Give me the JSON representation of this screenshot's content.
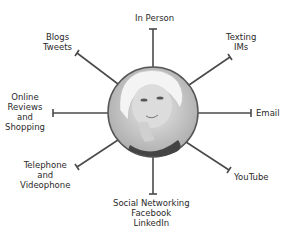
{
  "diagram": {
    "center": {
      "x": 153,
      "y": 112,
      "r": 45,
      "description": "Portrait of a thoughtful blonde woman (grayscale)"
    },
    "line_color": "#4a4a4a",
    "spokes": [
      {
        "id": "in-person",
        "label": "In Person",
        "x2": 153,
        "y2": 29
      },
      {
        "id": "texting",
        "label": "Texting\nIMs",
        "x2": 230,
        "y2": 57
      },
      {
        "id": "email",
        "label": "Email",
        "x2": 251,
        "y2": 113
      },
      {
        "id": "youtube",
        "label": "YouTube",
        "x2": 229,
        "y2": 170
      },
      {
        "id": "social",
        "label": "Social Networking\nFacebook\nLinkedIn",
        "x2": 153,
        "y2": 194
      },
      {
        "id": "telephone",
        "label": "Telephone\nand\nVideophone",
        "x2": 77,
        "y2": 167
      },
      {
        "id": "online-reviews",
        "label": "Online\nReviews\nand\nShopping",
        "x2": 53,
        "y2": 113
      },
      {
        "id": "blogs",
        "label": "Blogs\nTweets",
        "x2": 77,
        "y2": 53
      }
    ]
  },
  "labels": {
    "in_person": "In Person",
    "texting": "Texting\nIMs",
    "email": "Email",
    "youtube": "YouTube",
    "social": "Social Networking\nFacebook\nLinkedIn",
    "telephone": "Telephone\nand\nVideophone",
    "online_reviews": "Online\nReviews\nand\nShopping",
    "blogs": "Blogs\nTweets"
  }
}
